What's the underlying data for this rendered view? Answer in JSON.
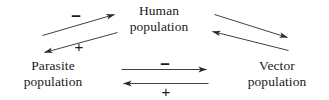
{
  "diagram": {
    "background_color": "#ffffff",
    "stroke_color": "#2b2b2b",
    "text_color": "#1a1a1a",
    "nodes": [
      {
        "id": "human",
        "label": "Human population",
        "line1": "Human",
        "line2": "population",
        "position": "top-center"
      },
      {
        "id": "parasite",
        "label": "Parasite population",
        "line1": "Parasite",
        "line2": "population",
        "position": "bottom-left"
      },
      {
        "id": "vector",
        "label": "Vector population",
        "line1": "Vector",
        "line2": "population",
        "position": "bottom-right"
      }
    ],
    "edges": [
      {
        "id": "parasite-to-human",
        "from": "parasite",
        "to": "human",
        "sign": "–",
        "sign_type": "minus",
        "direction": "up-right"
      },
      {
        "id": "human-to-parasite",
        "from": "human",
        "to": "parasite",
        "sign": "+",
        "sign_type": "plus",
        "direction": "down-left"
      },
      {
        "id": "vector-to-human",
        "from": "vector",
        "to": "human",
        "sign": "",
        "sign_type": "none",
        "direction": "up-left"
      },
      {
        "id": "human-to-vector",
        "from": "human",
        "to": "vector",
        "sign": "",
        "sign_type": "none",
        "direction": "down-right"
      },
      {
        "id": "parasite-to-vector",
        "from": "parasite",
        "to": "vector",
        "sign": "–",
        "sign_type": "minus",
        "direction": "right"
      },
      {
        "id": "vector-to-parasite",
        "from": "vector",
        "to": "parasite",
        "sign": "+",
        "sign_type": "plus",
        "direction": "left"
      }
    ]
  }
}
